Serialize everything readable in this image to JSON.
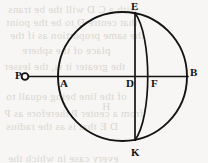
{
  "figure": {
    "kind": "geometric-diagram",
    "background_color": "#f7f6f4",
    "ink_color": "#141414",
    "bleed_color": "#d9d6d2",
    "labels": [
      {
        "id": "P",
        "text": "P",
        "x": 15,
        "y": 70
      },
      {
        "id": "A",
        "text": "A",
        "x": 60,
        "y": 78
      },
      {
        "id": "D",
        "text": "D",
        "x": 127,
        "y": 78
      },
      {
        "id": "F",
        "text": "F",
        "x": 151,
        "y": 78
      },
      {
        "id": "B",
        "text": "B",
        "x": 190,
        "y": 68
      },
      {
        "id": "E",
        "text": "E",
        "x": 131,
        "y": 1
      },
      {
        "id": "K",
        "text": "K",
        "x": 131,
        "y": 146
      }
    ],
    "circle": {
      "cx": 122.5,
      "cy": 76.5,
      "r": 64.5
    },
    "diameter_line": {
      "x1": 26,
      "y1": 76.5,
      "x2": 188,
      "y2": 76.5
    },
    "chord_ek": {
      "x1": 135,
      "y1": 13.5,
      "x2": 135,
      "y2": 140
    },
    "arc_efk": {
      "start_x": 135,
      "start_y": 13.5,
      "end_x": 135,
      "end_y": 140,
      "bulge_x": 149.5
    },
    "point_marker_p": {
      "cx": 25,
      "cy": 76.5,
      "r": 3.6
    }
  },
  "bleed_text": {
    "lines": [
      {
        "text": "with a  C  D  will the be trans",
        "x": 8,
        "y": 3
      },
      {
        "text": "that centre D  to  be  the  point",
        "x": 6,
        "y": 16
      },
      {
        "text": "the same proportion as if the",
        "x": 10,
        "y": 29
      },
      {
        "text": "place  of  the sphere",
        "x": 22,
        "y": 44
      },
      {
        "text": "the greater it is, the lesser",
        "x": 4,
        "y": 60
      },
      {
        "text": "of  the line being equall to",
        "x": 6,
        "y": 90
      },
      {
        "text": "H",
        "x": 102,
        "y": 100
      },
      {
        "text": "from a center  P  therefore  as  P",
        "x": 4,
        "y": 107
      },
      {
        "text": "D E  that  is  as  the  radius",
        "x": 6,
        "y": 120
      },
      {
        "text": "every case  in  which  the",
        "x": 8,
        "y": 152
      }
    ]
  }
}
